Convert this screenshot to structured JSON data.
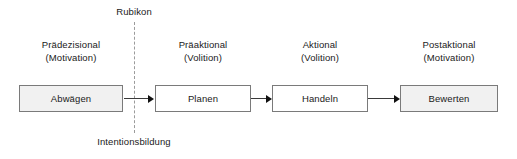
{
  "diagram": {
    "title_top": "Rubikon",
    "label_bottom": "Intentionsbildung",
    "phases": [
      {
        "heading_line1": "Prädezisional",
        "heading_line2": "(Motivation)",
        "box_label": "Abwägen",
        "fill": "#f1f1f1"
      },
      {
        "heading_line1": "Präaktional",
        "heading_line2": "(Volition)",
        "box_label": "Planen",
        "fill": "#ffffff"
      },
      {
        "heading_line1": "Aktional",
        "heading_line2": "(Volition)",
        "box_label": "Handeln",
        "fill": "#ffffff"
      },
      {
        "heading_line1": "Postaktional",
        "heading_line2": "(Motivation)",
        "box_label": "Bewerten",
        "fill": "#f1f1f1"
      }
    ],
    "colors": {
      "box_border": "#7a7a7a",
      "arrow": "#111111",
      "dashed_line": "#9b9b9b",
      "text": "#1a1a1a",
      "background": "#ffffff"
    }
  }
}
